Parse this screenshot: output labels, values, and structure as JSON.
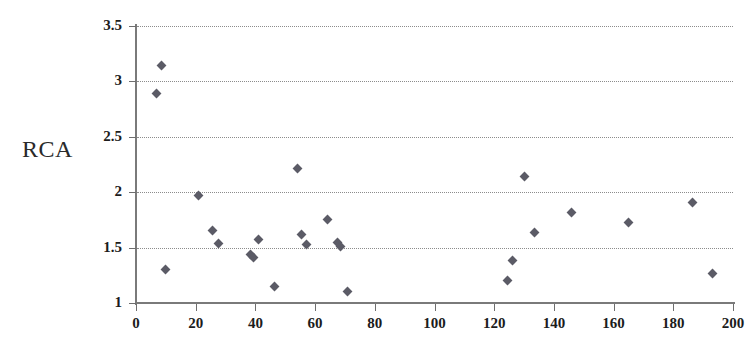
{
  "chart_data": {
    "type": "scatter",
    "title": "",
    "xlabel": "",
    "ylabel": "RCA",
    "xlim": [
      0,
      200
    ],
    "ylim": [
      1,
      3.5
    ],
    "xticks": [
      0,
      20,
      40,
      60,
      80,
      100,
      120,
      140,
      160,
      180,
      200
    ],
    "xtick_labels": [
      "0",
      "20",
      "40",
      "60",
      "80",
      "100",
      "120",
      "140",
      "160",
      "180",
      "200"
    ],
    "yticks": [
      1,
      1.5,
      2,
      2.5,
      3,
      3.5
    ],
    "ytick_labels": [
      "1",
      "1.5",
      "2",
      "2.5",
      "3",
      "3.5"
    ],
    "grid": "horizontal-dotted",
    "legend": null,
    "marker": "diamond",
    "marker_color": "#5b5b66",
    "series": [
      {
        "name": "RCA",
        "points": [
          {
            "x": 8.5,
            "y": 3.14
          },
          {
            "x": 7.0,
            "y": 2.89
          },
          {
            "x": 9.8,
            "y": 1.3
          },
          {
            "x": 21.0,
            "y": 1.97
          },
          {
            "x": 25.5,
            "y": 1.65
          },
          {
            "x": 27.5,
            "y": 1.54
          },
          {
            "x": 38.5,
            "y": 1.44
          },
          {
            "x": 39.5,
            "y": 1.41
          },
          {
            "x": 41.0,
            "y": 1.57
          },
          {
            "x": 46.5,
            "y": 1.15
          },
          {
            "x": 54.0,
            "y": 2.21
          },
          {
            "x": 55.5,
            "y": 1.62
          },
          {
            "x": 57.0,
            "y": 1.53
          },
          {
            "x": 64.0,
            "y": 1.75
          },
          {
            "x": 67.5,
            "y": 1.55
          },
          {
            "x": 68.5,
            "y": 1.51
          },
          {
            "x": 71.0,
            "y": 1.1
          },
          {
            "x": 124.5,
            "y": 1.2
          },
          {
            "x": 126.0,
            "y": 1.38
          },
          {
            "x": 130.0,
            "y": 2.14
          },
          {
            "x": 133.5,
            "y": 1.64
          },
          {
            "x": 146.0,
            "y": 1.82
          },
          {
            "x": 165.0,
            "y": 1.73
          },
          {
            "x": 186.5,
            "y": 1.91
          },
          {
            "x": 193.0,
            "y": 1.27
          }
        ]
      }
    ]
  },
  "axes": {
    "y_title": "RCA"
  }
}
